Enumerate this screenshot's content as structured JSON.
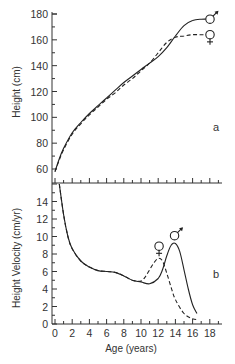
{
  "chart_data": [
    {
      "type": "line",
      "panel": "a",
      "ylabel": "Height (cm)",
      "xlabel": "",
      "ylim": [
        60,
        180
      ],
      "xlim": [
        0,
        20
      ],
      "yticks": [
        60,
        80,
        100,
        120,
        140,
        160,
        180
      ],
      "panel_label": "a",
      "series": [
        {
          "name": "male",
          "symbol": "♂",
          "style": "solid",
          "x": [
            0,
            0.5,
            1,
            2,
            3,
            4,
            5,
            6,
            7,
            8,
            9,
            10,
            11,
            12,
            13,
            14,
            15,
            16,
            17,
            18
          ],
          "y": [
            58,
            68,
            76,
            88,
            96,
            103,
            109,
            115,
            121,
            127,
            132,
            137,
            142,
            147,
            154,
            163,
            171,
            175,
            176,
            176
          ]
        },
        {
          "name": "female",
          "symbol": "♀",
          "style": "dashed",
          "x": [
            0,
            0.5,
            1,
            2,
            3,
            4,
            5,
            6,
            7,
            8,
            9,
            10,
            11,
            12,
            13,
            14,
            15,
            16,
            17,
            18
          ],
          "y": [
            58,
            67,
            75,
            87,
            95,
            102,
            108,
            114,
            119,
            125,
            130,
            136,
            142,
            150,
            158,
            162,
            163,
            164,
            164,
            164
          ]
        }
      ]
    },
    {
      "type": "line",
      "panel": "b",
      "ylabel": "Height Velocity (cm/yr)",
      "xlabel": "Age (years)",
      "ylim": [
        0,
        16
      ],
      "xlim": [
        0,
        20
      ],
      "yticks": [
        0,
        2,
        4,
        6,
        8,
        10,
        12,
        14
      ],
      "xticks": [
        0,
        2,
        4,
        6,
        8,
        10,
        12,
        14,
        16,
        18
      ],
      "panel_label": "b",
      "series": [
        {
          "name": "male",
          "symbol": "♂",
          "style": "solid",
          "x": [
            0.5,
            1,
            1.5,
            2,
            3,
            4,
            5,
            6,
            7,
            8,
            9,
            10,
            11,
            12,
            12.5,
            13,
            13.5,
            14,
            14.5,
            15,
            15.5,
            16,
            16.5
          ],
          "y": [
            16,
            12.5,
            10,
            8.6,
            7.2,
            6.5,
            6.1,
            6.0,
            5.9,
            5.5,
            5.0,
            4.8,
            4.6,
            5.2,
            6.2,
            7.8,
            9.0,
            9.2,
            8.3,
            6.2,
            4.0,
            2.2,
            1.2
          ]
        },
        {
          "name": "female",
          "symbol": "♀",
          "style": "dashed",
          "x": [
            0.5,
            1,
            1.5,
            2,
            3,
            4,
            5,
            6,
            7,
            8,
            9,
            10,
            10.5,
            11,
            11.5,
            12,
            12.5,
            13,
            13.5,
            14,
            15,
            16,
            16.5
          ],
          "y": [
            16,
            12.5,
            10,
            8.6,
            7.2,
            6.5,
            6.1,
            6.0,
            5.9,
            5.5,
            5.0,
            4.9,
            5.4,
            6.2,
            7.0,
            7.5,
            7.2,
            5.8,
            4.2,
            2.8,
            1.2,
            0.6,
            0.5
          ]
        }
      ]
    }
  ]
}
